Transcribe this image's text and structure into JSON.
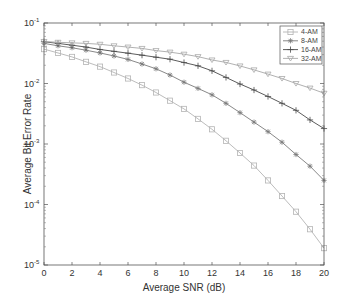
{
  "chart_data": {
    "type": "line",
    "title": "",
    "xlabel": "Average SNR (dB)",
    "ylabel": "Average Bit Error Rate",
    "xlim": [
      0,
      20
    ],
    "ylim": [
      1e-05,
      0.1
    ],
    "yscale": "log",
    "grid": false,
    "legend_position": "upper right",
    "x_ticks": [
      0,
      2,
      4,
      6,
      8,
      10,
      12,
      14,
      16,
      18,
      20
    ],
    "y_ticks": [
      {
        "value": 0.1,
        "base": "10",
        "exp": "-1"
      },
      {
        "value": 0.01,
        "base": "10",
        "exp": "-2"
      },
      {
        "value": 0.001,
        "base": "10",
        "exp": "-3"
      },
      {
        "value": 0.0001,
        "base": "10",
        "exp": "-4"
      },
      {
        "value": 1e-05,
        "base": "10",
        "exp": "-5"
      }
    ],
    "x": [
      0,
      1,
      2,
      3,
      4,
      5,
      6,
      7,
      8,
      9,
      10,
      11,
      12,
      13,
      14,
      15,
      16,
      17,
      18,
      19,
      20
    ],
    "series": [
      {
        "name": "4-AM",
        "color": "#b4b4b4",
        "marker": "square",
        "values": [
          0.037,
          0.032,
          0.0275,
          0.0228,
          0.019,
          0.0152,
          0.0121,
          0.0094,
          0.0071,
          0.0052,
          0.0038,
          0.0026,
          0.00175,
          0.00113,
          0.00071,
          0.00044,
          0.00025,
          0.000138,
          7.6e-05,
          3.9e-05,
          1.9e-05
        ]
      },
      {
        "name": "8-AM",
        "color": "#7a7a7a",
        "marker": "star",
        "values": [
          0.046,
          0.042,
          0.039,
          0.0355,
          0.032,
          0.0285,
          0.025,
          0.021,
          0.0175,
          0.0138,
          0.0105,
          0.0083,
          0.0065,
          0.0047,
          0.0033,
          0.0023,
          0.0016,
          0.00107,
          0.00067,
          0.00043,
          0.00025
        ]
      },
      {
        "name": "16-AM",
        "color": "#4a4a4a",
        "marker": "plus",
        "values": [
          0.049,
          0.046,
          0.043,
          0.04,
          0.0365,
          0.034,
          0.0317,
          0.0294,
          0.0272,
          0.0252,
          0.0222,
          0.0196,
          0.0162,
          0.0126,
          0.0098,
          0.0078,
          0.0061,
          0.0047,
          0.0036,
          0.0025,
          0.0018
        ]
      },
      {
        "name": "32-AM",
        "color": "#a8a8a8",
        "marker": "triangle-down",
        "values": [
          0.0495,
          0.048,
          0.047,
          0.046,
          0.0445,
          0.042,
          0.04,
          0.038,
          0.035,
          0.033,
          0.0305,
          0.0278,
          0.0245,
          0.0223,
          0.0195,
          0.0168,
          0.0143,
          0.0121,
          0.01,
          0.0084,
          0.0069
        ]
      }
    ]
  }
}
